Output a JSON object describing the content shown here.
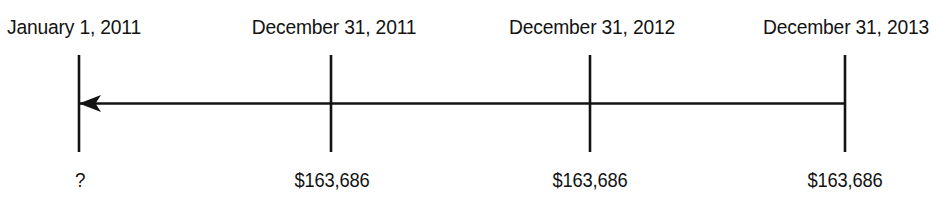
{
  "figure": {
    "type": "timeline",
    "title": "",
    "background_color": "#ffffff",
    "line_color": "#131313",
    "text_color": "#131313",
    "direction": "right-to-left",
    "arrow_position": "left-end",
    "axis": {
      "y": 103,
      "x_start": 79,
      "x_end": 845,
      "arrow_head": "left"
    },
    "tick_marks": [
      {
        "x": 79,
        "y_top": 55,
        "y_bottom": 152
      },
      {
        "x": 331,
        "y_top": 55,
        "y_bottom": 152
      },
      {
        "x": 590,
        "y_top": 55,
        "y_bottom": 152
      },
      {
        "x": 845,
        "y_top": 55,
        "y_bottom": 152
      }
    ],
    "points": [
      {
        "id": "point-0",
        "date_label": "January 1, 2011",
        "value_label": "?",
        "tick_x": 79,
        "date_align": "left",
        "date_x": 7
      },
      {
        "id": "point-1",
        "date_label": "December 31, 2011",
        "value_label": "$163,686",
        "tick_x": 331,
        "date_align": "center",
        "date_x": 334
      },
      {
        "id": "point-2",
        "date_label": "December 31, 2012",
        "value_label": "$163,686",
        "tick_x": 590,
        "date_align": "center",
        "date_x": 592
      },
      {
        "id": "point-3",
        "date_label": "December 31, 2013",
        "value_label": "$163,686",
        "tick_x": 845,
        "date_align": "center",
        "date_x": 846
      }
    ]
  }
}
